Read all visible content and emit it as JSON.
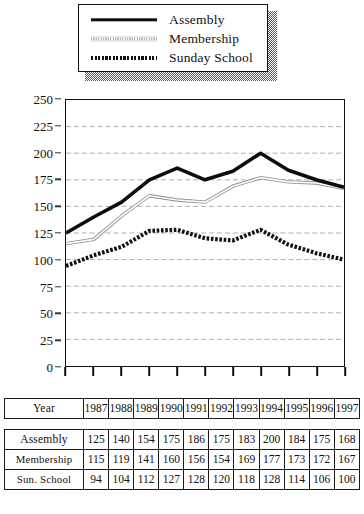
{
  "legend": {
    "entries": [
      {
        "label": "Assembly",
        "style": "solid-thick",
        "swatch_name": "assembly"
      },
      {
        "label": "Membership",
        "style": "thin-hatched",
        "swatch_name": "membership"
      },
      {
        "label": "Sunday School",
        "style": "bold-dashed",
        "swatch_name": "sunday"
      }
    ]
  },
  "table": {
    "year_row_label": "Year",
    "years": [
      "1987",
      "1988",
      "1989",
      "1990",
      "1991",
      "1992",
      "1993",
      "1994",
      "1995",
      "1996",
      "1997"
    ],
    "rows": [
      {
        "label": "Assembly",
        "values": [
          "125",
          "140",
          "154",
          "175",
          "186",
          "175",
          "183",
          "200",
          "184",
          "175",
          "168"
        ]
      },
      {
        "label": "Membership",
        "values": [
          "115",
          "119",
          "141",
          "160",
          "156",
          "154",
          "169",
          "177",
          "173",
          "172",
          "167"
        ]
      },
      {
        "label": "Sun. School",
        "values": [
          "94",
          "104",
          "112",
          "127",
          "128",
          "120",
          "118",
          "128",
          "114",
          "106",
          "100"
        ]
      }
    ]
  },
  "chart_data": {
    "type": "line",
    "title": "",
    "xlabel": "Year",
    "ylabel": "",
    "x": [
      1987,
      1988,
      1989,
      1990,
      1991,
      1992,
      1993,
      1994,
      1995,
      1996,
      1997
    ],
    "categories": [
      "1987",
      "1988",
      "1989",
      "1990",
      "1991",
      "1992",
      "1993",
      "1994",
      "1995",
      "1996",
      "1997"
    ],
    "series": [
      {
        "name": "Assembly",
        "values": [
          125,
          140,
          154,
          175,
          186,
          175,
          183,
          200,
          184,
          175,
          168
        ]
      },
      {
        "name": "Membership",
        "values": [
          115,
          119,
          141,
          160,
          156,
          154,
          169,
          177,
          173,
          172,
          167
        ]
      },
      {
        "name": "Sunday School",
        "values": [
          94,
          104,
          112,
          127,
          128,
          120,
          118,
          128,
          114,
          106,
          100
        ]
      }
    ],
    "ylim": [
      0,
      250
    ],
    "yticks": [
      0,
      25,
      50,
      75,
      100,
      125,
      150,
      175,
      200,
      225,
      250
    ],
    "ytick_labels": [
      "0",
      "25",
      "50",
      "75",
      "100",
      "125",
      "150",
      "175",
      "200",
      "225",
      "250"
    ],
    "grid": true,
    "grid_color": "#9a9a9a",
    "legend_position": "above-plot",
    "colors": {
      "assembly": "#0d0d0d",
      "membership": "#c9c9c9",
      "sunday_school": "#111111"
    }
  }
}
